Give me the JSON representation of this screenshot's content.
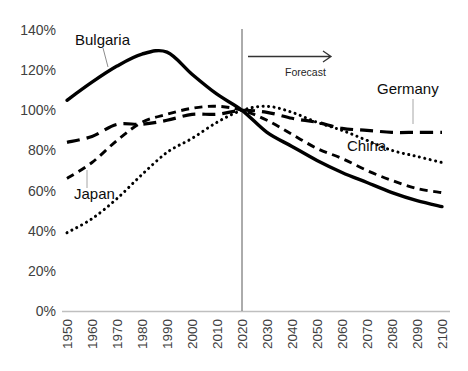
{
  "chart_data": {
    "type": "line",
    "title": "",
    "x": [
      1950,
      1960,
      1970,
      1980,
      1990,
      2000,
      2010,
      2020,
      2030,
      2040,
      2050,
      2060,
      2070,
      2080,
      2090,
      2100
    ],
    "x_tick_labels": [
      "1950",
      "1960",
      "1970",
      "1980",
      "1990",
      "2000",
      "2010",
      "2020",
      "2030",
      "2040",
      "2050",
      "2060",
      "2070",
      "2080",
      "2090",
      "2100"
    ],
    "y_ticks": [
      0,
      20,
      40,
      60,
      80,
      100,
      120,
      140
    ],
    "y_tick_labels": [
      "0%",
      "20%",
      "40%",
      "60%",
      "80%",
      "100%",
      "120%",
      "140%"
    ],
    "ylim": [
      0,
      140
    ],
    "grid": false,
    "legend_position": "inline-labels",
    "line_color": "#000000",
    "series": [
      {
        "name": "Bulgaria",
        "line_style": "solid",
        "color": "#000000",
        "values": [
          105,
          114,
          122,
          128,
          129,
          118,
          108,
          100,
          89,
          82,
          75,
          69,
          64,
          59,
          55,
          52
        ]
      },
      {
        "name": "Japan",
        "line_style": "dashed",
        "color": "#000000",
        "values": [
          66,
          74,
          85,
          94,
          98,
          101,
          102,
          100,
          95,
          88,
          81,
          76,
          70,
          65,
          61,
          59
        ]
      },
      {
        "name": "China",
        "line_style": "dotted",
        "color": "#000000",
        "values": [
          39,
          46,
          56,
          68,
          79,
          86,
          94,
          100,
          102,
          99,
          94,
          90,
          85,
          80,
          77,
          74
        ]
      },
      {
        "name": "Germany",
        "line_style": "long-dash",
        "color": "#000000",
        "values": [
          84,
          87,
          93,
          93,
          95,
          98,
          98,
          100,
          99,
          96,
          94,
          91,
          90,
          89,
          89,
          89
        ]
      }
    ],
    "annotations": {
      "forecast_label": "Forecast",
      "forecast_divider_x": 2020,
      "forecast_arrow": "right-arrow"
    },
    "axis_color": "#bfbfbf",
    "divider_color": "#595959",
    "tick_label_color": "#404040"
  }
}
